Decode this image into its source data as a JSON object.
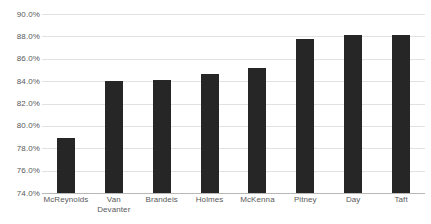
{
  "chart_data": {
    "type": "bar",
    "title": "",
    "subtitle": "",
    "xlabel": "",
    "ylabel": "",
    "categories": [
      "McReynolds",
      "Van Devanter",
      "Brandeis",
      "Holmes",
      "McKenna",
      "Pitney",
      "Day",
      "Taft"
    ],
    "values": [
      78.9,
      84.0,
      84.1,
      84.6,
      85.2,
      87.8,
      88.1,
      88.1
    ],
    "ylim": [
      74.0,
      90.0
    ],
    "ytick_step": 2.0,
    "ytick_labels": [
      "90.0%",
      "88.0%",
      "86.0%",
      "84.0%",
      "82.0%",
      "80.0%",
      "78.0%",
      "76.0%",
      "74.0%"
    ],
    "ytick_values": [
      90.0,
      88.0,
      86.0,
      84.0,
      82.0,
      80.0,
      78.0,
      76.0,
      74.0
    ],
    "grid": true,
    "grid_axis": "y",
    "legend": false,
    "legend_position": "none",
    "series": [
      {
        "name": "",
        "values": [
          78.9,
          84.0,
          84.1,
          84.6,
          85.2,
          87.8,
          88.1,
          88.1
        ]
      }
    ],
    "annotations": []
  },
  "style": {
    "bar_color": "#262626",
    "gridline_color": "#e2e2e2",
    "axis_color": "#b8b8b8",
    "tick_label_color": "#59595b",
    "background_color": "#ffffff"
  }
}
